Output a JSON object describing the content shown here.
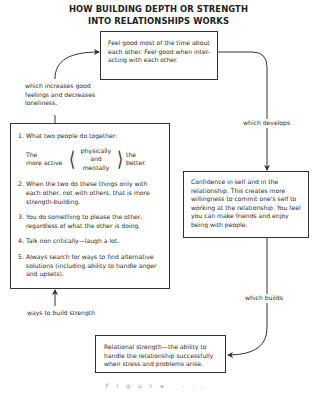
{
  "title": {
    "line1": "HOW BUILDING DEPTH OR STRENGTH",
    "line2": "INTO RELATIONSHIPS WORKS"
  },
  "boxes": {
    "feel_good": "Feel good most of the time about each other. Feel good when inter-acting with each other.",
    "confidence": "Confidence in self and in the relationship. This creates more willingness to commit one's self to working at the relationship. You feel you can make friends and enjoy being with people.",
    "relational_strength": "Relational strength—the ability to handle the relationship successfully when stress and problems arise."
  },
  "ways_box": {
    "items": [
      {
        "num": "1.",
        "text": "What two people do together:"
      },
      {
        "num": "2.",
        "text": "When the two do these things only with each other, not with others, that is more strength-building."
      },
      {
        "num": "3.",
        "text": "You do something to please the other, regardless of what the other is doing."
      },
      {
        "num": "4.",
        "text": "Talk non critically—laugh a lot."
      },
      {
        "num": "5.",
        "text": "Always search for ways to find alternative solutions (including ability to handle anger and upsets)."
      }
    ],
    "active": {
      "left_line1": "The",
      "left_line2": "more active",
      "mid_line1": "physically",
      "mid_line2": "and",
      "mid_line3": "mentally",
      "right_line1": "the",
      "right_line2": "better."
    }
  },
  "labels": {
    "increases": "which increases good feelings and decreases loneliness.",
    "develops": "which develops",
    "builds": "which builds",
    "ways": "ways to build strength"
  },
  "caption": "Figure ..."
}
